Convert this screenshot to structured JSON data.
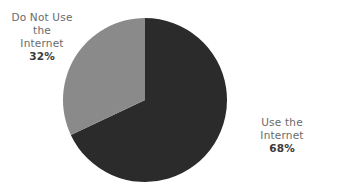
{
  "chart_data": {
    "type": "pie",
    "title": "",
    "categories": [
      "Use the Internet",
      "Do Not Use the Internet"
    ],
    "values": [
      68,
      32
    ],
    "unit": "%",
    "colors": [
      "#2b2b2b",
      "#8a8a8a"
    ],
    "start_angle": "12 o'clock",
    "labels": [
      {
        "line1": "Use the Internet",
        "line2": "",
        "pct": "68%"
      },
      {
        "line1": "Do Not Use",
        "line2": "the Internet",
        "pct": "32%"
      }
    ],
    "legend": "none (direct labels)"
  }
}
